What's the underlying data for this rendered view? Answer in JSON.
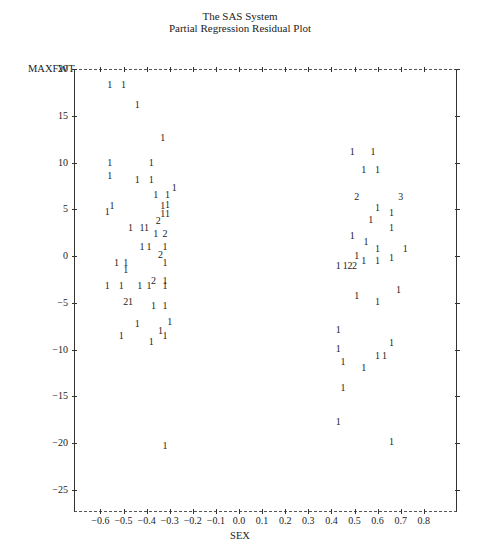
{
  "header": {
    "line1": "The SAS System",
    "line2": "Partial Regression Residual Plot"
  },
  "chart_data": {
    "type": "scatter",
    "title": "The SAS System",
    "subtitle": "Partial Regression Residual Plot",
    "xlabel": "SEX",
    "ylabel": "MAXFWT",
    "xlim": [
      -0.72,
      0.95
    ],
    "ylim": [
      -27,
      20
    ],
    "x_ticks": [
      "-0.6",
      "-0.5",
      "-0.4",
      "-0.3",
      "-0.2",
      "-0.1",
      "0.0",
      "0.1",
      "0.2",
      "0.3",
      "0.4",
      "0.5",
      "0.6",
      "0.7",
      "0.8"
    ],
    "y_ticks": [
      "20",
      "15",
      "10",
      "5",
      "0",
      "-5",
      "-10",
      "-15",
      "-20",
      "-25"
    ],
    "grid": false,
    "legend": "none (plot symbols: 1 = one obs, 2 = two obs, 3 = three obs)",
    "points": [
      {
        "x": -0.56,
        "y": 18.3,
        "sym": "1"
      },
      {
        "x": -0.5,
        "y": 18.3,
        "sym": "1"
      },
      {
        "x": -0.44,
        "y": 16.2,
        "sym": "1"
      },
      {
        "x": -0.33,
        "y": 12.6,
        "sym": "1"
      },
      {
        "x": -0.56,
        "y": 10.0,
        "sym": "1"
      },
      {
        "x": -0.38,
        "y": 10.0,
        "sym": "1"
      },
      {
        "x": -0.56,
        "y": 8.6,
        "sym": "1"
      },
      {
        "x": -0.44,
        "y": 8.1,
        "sym": "1"
      },
      {
        "x": -0.38,
        "y": 8.1,
        "sym": "1"
      },
      {
        "x": -0.28,
        "y": 7.3,
        "sym": "1"
      },
      {
        "x": -0.36,
        "y": 6.5,
        "sym": "1"
      },
      {
        "x": -0.31,
        "y": 6.5,
        "sym": "1"
      },
      {
        "x": -0.31,
        "y": 5.5,
        "sym": "1"
      },
      {
        "x": -0.33,
        "y": 5.3,
        "sym": "1"
      },
      {
        "x": -0.55,
        "y": 5.4,
        "sym": "1"
      },
      {
        "x": -0.57,
        "y": 4.7,
        "sym": "1"
      },
      {
        "x": -0.33,
        "y": 4.5,
        "sym": "1"
      },
      {
        "x": -0.31,
        "y": 4.5,
        "sym": "1"
      },
      {
        "x": -0.35,
        "y": 3.7,
        "sym": "2"
      },
      {
        "x": -0.47,
        "y": 3.0,
        "sym": "1"
      },
      {
        "x": -0.42,
        "y": 3.0,
        "sym": "1"
      },
      {
        "x": -0.4,
        "y": 3.0,
        "sym": "1"
      },
      {
        "x": -0.36,
        "y": 2.3,
        "sym": "1"
      },
      {
        "x": -0.32,
        "y": 2.3,
        "sym": "2"
      },
      {
        "x": -0.42,
        "y": 1.0,
        "sym": "1"
      },
      {
        "x": -0.39,
        "y": 1.0,
        "sym": "1"
      },
      {
        "x": -0.32,
        "y": 1.0,
        "sym": "1"
      },
      {
        "x": -0.34,
        "y": 0.1,
        "sym": "2"
      },
      {
        "x": -0.53,
        "y": -0.8,
        "sym": "1"
      },
      {
        "x": -0.49,
        "y": -0.8,
        "sym": "1"
      },
      {
        "x": -0.32,
        "y": -0.8,
        "sym": "1"
      },
      {
        "x": -0.49,
        "y": -1.5,
        "sym": "1"
      },
      {
        "x": -0.37,
        "y": -2.7,
        "sym": "2"
      },
      {
        "x": -0.32,
        "y": -2.7,
        "sym": "1"
      },
      {
        "x": -0.57,
        "y": -3.2,
        "sym": "1"
      },
      {
        "x": -0.51,
        "y": -3.2,
        "sym": "1"
      },
      {
        "x": -0.43,
        "y": -3.2,
        "sym": "1"
      },
      {
        "x": -0.39,
        "y": -3.2,
        "sym": "1"
      },
      {
        "x": -0.32,
        "y": -3.2,
        "sym": "1"
      },
      {
        "x": -0.49,
        "y": -4.9,
        "sym": "2"
      },
      {
        "x": -0.47,
        "y": -4.9,
        "sym": "1"
      },
      {
        "x": -0.37,
        "y": -5.4,
        "sym": "1"
      },
      {
        "x": -0.32,
        "y": -5.4,
        "sym": "1"
      },
      {
        "x": -0.44,
        "y": -7.3,
        "sym": "1"
      },
      {
        "x": -0.3,
        "y": -7.1,
        "sym": "1"
      },
      {
        "x": -0.34,
        "y": -8.0,
        "sym": "1"
      },
      {
        "x": -0.51,
        "y": -8.6,
        "sym": "1"
      },
      {
        "x": -0.32,
        "y": -8.6,
        "sym": "1"
      },
      {
        "x": -0.38,
        "y": -9.2,
        "sym": "1"
      },
      {
        "x": -0.32,
        "y": -20.3,
        "sym": "1"
      },
      {
        "x": 0.49,
        "y": 11.1,
        "sym": "1"
      },
      {
        "x": 0.58,
        "y": 11.1,
        "sym": "1"
      },
      {
        "x": 0.54,
        "y": 9.2,
        "sym": "1"
      },
      {
        "x": 0.6,
        "y": 9.2,
        "sym": "1"
      },
      {
        "x": 0.51,
        "y": 6.3,
        "sym": "2"
      },
      {
        "x": 0.7,
        "y": 6.3,
        "sym": "3"
      },
      {
        "x": 0.6,
        "y": 5.1,
        "sym": "1"
      },
      {
        "x": 0.66,
        "y": 4.6,
        "sym": "1"
      },
      {
        "x": 0.57,
        "y": 3.8,
        "sym": "1"
      },
      {
        "x": 0.66,
        "y": 3.0,
        "sym": "1"
      },
      {
        "x": 0.49,
        "y": 2.1,
        "sym": "1"
      },
      {
        "x": 0.55,
        "y": 1.5,
        "sym": "1"
      },
      {
        "x": 0.6,
        "y": 0.7,
        "sym": "1"
      },
      {
        "x": 0.72,
        "y": 0.7,
        "sym": "1"
      },
      {
        "x": 0.51,
        "y": 0.0,
        "sym": "1"
      },
      {
        "x": 0.54,
        "y": -0.5,
        "sym": "1"
      },
      {
        "x": 0.6,
        "y": -0.5,
        "sym": "1"
      },
      {
        "x": 0.66,
        "y": -0.2,
        "sym": "1"
      },
      {
        "x": 0.43,
        "y": -1.1,
        "sym": "1"
      },
      {
        "x": 0.46,
        "y": -1.1,
        "sym": "1"
      },
      {
        "x": 0.48,
        "y": -1.1,
        "sym": "2"
      },
      {
        "x": 0.5,
        "y": -1.1,
        "sym": "2"
      },
      {
        "x": 0.69,
        "y": -3.6,
        "sym": "1"
      },
      {
        "x": 0.51,
        "y": -4.3,
        "sym": "1"
      },
      {
        "x": 0.6,
        "y": -4.9,
        "sym": "1"
      },
      {
        "x": 0.43,
        "y": -7.9,
        "sym": "1"
      },
      {
        "x": 0.66,
        "y": -9.3,
        "sym": "1"
      },
      {
        "x": 0.43,
        "y": -9.9,
        "sym": "1"
      },
      {
        "x": 0.6,
        "y": -10.7,
        "sym": "1"
      },
      {
        "x": 0.63,
        "y": -10.7,
        "sym": "1"
      },
      {
        "x": 0.45,
        "y": -11.3,
        "sym": "1"
      },
      {
        "x": 0.54,
        "y": -12.0,
        "sym": "1"
      },
      {
        "x": 0.45,
        "y": -14.1,
        "sym": "1"
      },
      {
        "x": 0.43,
        "y": -17.8,
        "sym": "1"
      },
      {
        "x": 0.66,
        "y": -19.9,
        "sym": "1"
      }
    ]
  }
}
